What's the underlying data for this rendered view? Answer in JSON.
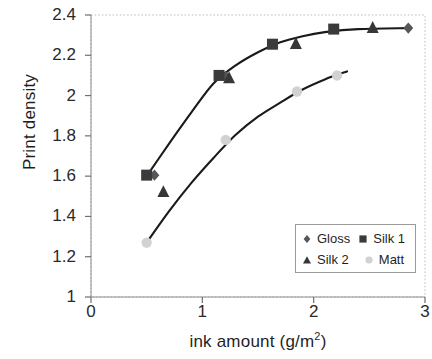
{
  "chart_data": {
    "type": "scatter",
    "title": "",
    "subtitle": "",
    "xlabel": "ink amount (g/m2)",
    "xlabel_base": "ink amount (g/m",
    "xlabel_sup": "2",
    "xlabel_tail": ")",
    "ylabel": "Print density",
    "xlim": [
      0,
      3
    ],
    "ylim": [
      1,
      2.4
    ],
    "xticks": [
      "0",
      "1",
      "2",
      "3"
    ],
    "xtick_values": [
      0,
      1,
      2,
      3
    ],
    "yticks": [
      "1",
      "1.2",
      "1.4",
      "1.6",
      "1.8",
      "2",
      "2.2",
      "2.4"
    ],
    "ytick_values": [
      1,
      1.2,
      1.4,
      1.6,
      1.8,
      2,
      2.2,
      2.4
    ],
    "grid": false,
    "legend_position": "lower right",
    "series": [
      {
        "name": "Gloss",
        "marker": "diamond",
        "color": "#55555a",
        "points": [
          {
            "x": 0.57,
            "y": 1.605
          },
          {
            "x": 1.21,
            "y": 2.095
          },
          {
            "x": 2.85,
            "y": 2.335
          }
        ]
      },
      {
        "name": "Silk 1",
        "marker": "square",
        "color": "#3a3a3d",
        "points": [
          {
            "x": 0.5,
            "y": 1.605
          },
          {
            "x": 1.15,
            "y": 2.1
          },
          {
            "x": 1.63,
            "y": 2.255
          },
          {
            "x": 2.18,
            "y": 2.33
          }
        ]
      },
      {
        "name": "Silk 2",
        "marker": "triangle",
        "color": "#37373a",
        "points": [
          {
            "x": 0.65,
            "y": 1.52
          },
          {
            "x": 1.24,
            "y": 2.085
          },
          {
            "x": 1.84,
            "y": 2.255
          },
          {
            "x": 2.53,
            "y": 2.335
          }
        ]
      },
      {
        "name": "Matt",
        "marker": "circle",
        "color": "#d2d2d2",
        "points": [
          {
            "x": 0.5,
            "y": 1.27
          },
          {
            "x": 1.21,
            "y": 1.78
          },
          {
            "x": 1.85,
            "y": 2.02
          },
          {
            "x": 2.21,
            "y": 2.1
          }
        ]
      }
    ],
    "curves": [
      {
        "name": "upper-curve",
        "points": [
          {
            "x": 0.5,
            "y": 1.6
          },
          {
            "x": 0.7,
            "y": 1.76
          },
          {
            "x": 0.9,
            "y": 1.915
          },
          {
            "x": 1.1,
            "y": 2.06
          },
          {
            "x": 1.3,
            "y": 2.15
          },
          {
            "x": 1.5,
            "y": 2.215
          },
          {
            "x": 1.7,
            "y": 2.265
          },
          {
            "x": 1.9,
            "y": 2.295
          },
          {
            "x": 2.1,
            "y": 2.315
          },
          {
            "x": 2.4,
            "y": 2.33
          },
          {
            "x": 2.85,
            "y": 2.335
          }
        ]
      },
      {
        "name": "lower-curve",
        "points": [
          {
            "x": 0.5,
            "y": 1.27
          },
          {
            "x": 0.7,
            "y": 1.425
          },
          {
            "x": 0.9,
            "y": 1.565
          },
          {
            "x": 1.1,
            "y": 1.69
          },
          {
            "x": 1.3,
            "y": 1.805
          },
          {
            "x": 1.5,
            "y": 1.895
          },
          {
            "x": 1.7,
            "y": 1.965
          },
          {
            "x": 1.9,
            "y": 2.03
          },
          {
            "x": 2.1,
            "y": 2.08
          },
          {
            "x": 2.3,
            "y": 2.12
          }
        ]
      }
    ]
  },
  "legend": {
    "entries": [
      {
        "label": "Gloss",
        "marker": "diamond"
      },
      {
        "label": "Silk 1",
        "marker": "square"
      },
      {
        "label": "Silk 2",
        "marker": "triangle"
      },
      {
        "label": "Matt",
        "marker": "circle"
      }
    ]
  },
  "colors": {
    "axis": "#bdbdbd",
    "curve": "#1a1a1a",
    "marker_dark": "#3a3a3d",
    "marker_light": "#d2d2d2",
    "text": "#1f1f1f"
  }
}
